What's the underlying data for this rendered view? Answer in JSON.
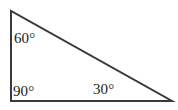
{
  "figure": {
    "kind": "geometry-diagram",
    "shape_name": "right triangle",
    "background_color": "#ffffff",
    "stroke_color": "#3a3a3a",
    "stroke_width_px": 2,
    "width_px": 178,
    "height_px": 110
  },
  "triangle": {
    "vertices": [
      {
        "id": "apex",
        "name": "top-left apex",
        "x": 11,
        "y": 11,
        "angle_label": "60°",
        "angle_value": 60
      },
      {
        "id": "right-angle",
        "name": "bottom-left right angle",
        "x": 11,
        "y": 101,
        "angle_label": "90°",
        "angle_value": 90
      },
      {
        "id": "base-right",
        "name": "bottom-right vertex",
        "x": 172,
        "y": 101,
        "angle_label": "30°",
        "angle_value": 30
      }
    ],
    "sides": [
      {
        "id": "left-leg",
        "name": "vertical left leg",
        "from": "apex",
        "to": "right-angle"
      },
      {
        "id": "bottom-leg",
        "name": "horizontal bottom leg",
        "from": "right-angle",
        "to": "base-right"
      },
      {
        "id": "hypotenuse",
        "name": "hypotenuse",
        "from": "apex",
        "to": "base-right"
      }
    ],
    "angle_sum": "180°"
  },
  "labels": {
    "apex": "60°",
    "right_angle": "90°",
    "base_right": "30°"
  },
  "chart_data": {
    "type": "diagram",
    "title": "",
    "categories": [
      "60°",
      "90°",
      "30°"
    ],
    "values": [
      60,
      90,
      30
    ],
    "annotations": [
      "60°",
      "90°",
      "30°"
    ]
  }
}
